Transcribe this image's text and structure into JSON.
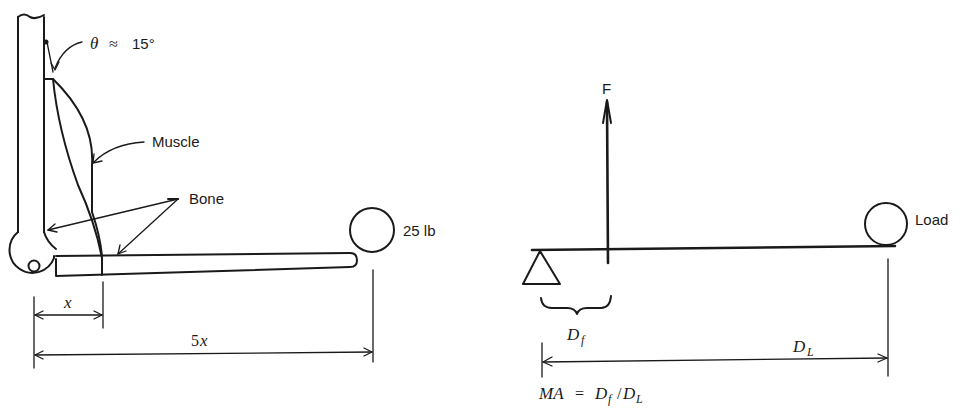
{
  "figure": {
    "left_panel": {
      "title": "Forearm lever (anatomical)",
      "angle_label": {
        "symbol": "θ",
        "relation": "≈",
        "value": "15°"
      },
      "muscle_label": "Muscle",
      "bone_label": "Bone",
      "load_label": "25 lb",
      "dim_short": {
        "coef": "",
        "var": "x"
      },
      "dim_long": {
        "coef": "5",
        "var": "x"
      }
    },
    "right_panel": {
      "title": "Lever model",
      "force_label": "F",
      "load_label": "Load",
      "fulcrum_distance": {
        "var": "D",
        "sub": "f"
      },
      "load_distance": {
        "var": "D",
        "sub": "L"
      },
      "formula": {
        "lhs": "MA",
        "eq": "=",
        "num_var": "D",
        "num_sub": "f",
        "slash": "/",
        "den_var": "D",
        "den_sub": "L"
      }
    },
    "colors": {
      "ink": "#1a1a1a",
      "background": "#ffffff"
    }
  }
}
